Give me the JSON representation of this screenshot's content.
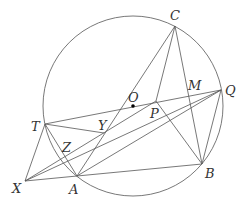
{
  "diagram": {
    "type": "geometry",
    "circle": {
      "center": "O",
      "cx": 133,
      "cy": 106,
      "r": 90
    },
    "points": {
      "C": {
        "x": 175,
        "y": 26,
        "lx": 170,
        "ly": 20,
        "label": "C"
      },
      "Q": {
        "x": 221,
        "y": 90,
        "lx": 225,
        "ly": 95,
        "label": "Q"
      },
      "M": {
        "x": 191,
        "y": 94,
        "lx": 188,
        "ly": 90,
        "label": "M"
      },
      "O": {
        "x": 133,
        "y": 106,
        "lx": 128,
        "ly": 102,
        "label": "O"
      },
      "P": {
        "x": 156,
        "y": 101,
        "lx": 150,
        "ly": 118,
        "label": "P"
      },
      "T": {
        "x": 45,
        "y": 124,
        "lx": 31,
        "ly": 131,
        "label": "T"
      },
      "Y": {
        "x": 104,
        "y": 133,
        "lx": 98,
        "ly": 130,
        "label": "Y"
      },
      "Z": {
        "x": 65,
        "y": 151,
        "lx": 62,
        "ly": 152,
        "label": "Z"
      },
      "X": {
        "x": 25,
        "y": 181,
        "lx": 12,
        "ly": 193,
        "label": "X"
      },
      "A": {
        "x": 77,
        "y": 176,
        "lx": 69,
        "ly": 194,
        "label": "A"
      },
      "B": {
        "x": 202,
        "y": 164,
        "lx": 205,
        "ly": 178,
        "label": "B"
      }
    },
    "segments": [
      [
        "C",
        "A"
      ],
      [
        "C",
        "P"
      ],
      [
        "C",
        "B"
      ],
      [
        "T",
        "Q"
      ],
      [
        "T",
        "Y"
      ],
      [
        "T",
        "X"
      ],
      [
        "T",
        "A"
      ],
      [
        "X",
        "A"
      ],
      [
        "X",
        "P"
      ],
      [
        "A",
        "B"
      ],
      [
        "A",
        "Q"
      ],
      [
        "P",
        "B"
      ],
      [
        "Q",
        "B"
      ],
      [
        "X",
        "Q"
      ]
    ]
  }
}
